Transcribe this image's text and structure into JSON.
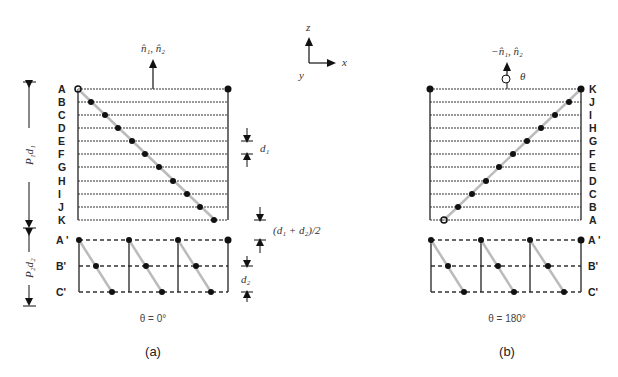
{
  "axes": {
    "z": "z",
    "x": "x",
    "y": "y"
  },
  "panel_a": {
    "caption": "(a)",
    "angle": "θ = 0°",
    "normal_label": "n̂₁, n̂₂",
    "rows_top": [
      "A",
      "B",
      "C",
      "D",
      "E",
      "F",
      "G",
      "H",
      "I",
      "J",
      "K"
    ],
    "rows_bottom": [
      "A '",
      "B'",
      "C'"
    ],
    "dim_p1d1": "P₁d₁",
    "dim_p2d2": "P₂d₂",
    "dim_d1": "d₁",
    "dim_d1d2": "(d₁ + d₂)/2",
    "dim_d2": "d₂"
  },
  "panel_b": {
    "caption": "(b)",
    "angle": "θ = 180°",
    "normal_label": "−n̂₁, n̂₂",
    "rotation_label": "θ",
    "rows_top": [
      "K",
      "J",
      "I",
      "H",
      "G",
      "F",
      "E",
      "D",
      "C",
      "B",
      "A"
    ],
    "rows_bottom": [
      "A '",
      "B'",
      "C'"
    ]
  }
}
